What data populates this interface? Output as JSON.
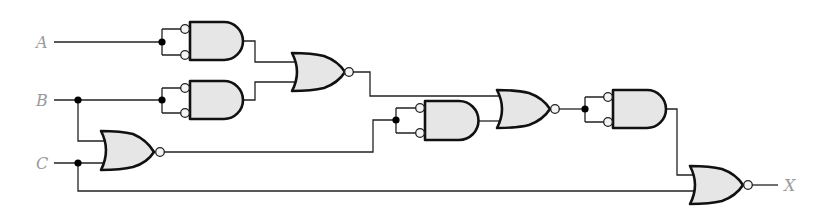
{
  "diagram": {
    "type": "logic-circuit",
    "inputs": [
      {
        "label": "A",
        "x": 40,
        "y": 42
      },
      {
        "label": "B",
        "x": 40,
        "y": 100
      },
      {
        "label": "C",
        "x": 40,
        "y": 163
      }
    ],
    "output": {
      "label": "X",
      "x": 790,
      "y": 185
    },
    "colors": {
      "gate_fill": "#e6e6e6",
      "gate_stroke": "#111111",
      "wire": "#222222",
      "label": "#9a9a9a"
    },
    "gates": [
      {
        "id": "and1",
        "type": "AND",
        "inverted_inputs": true,
        "inputs": [
          "A",
          "A"
        ]
      },
      {
        "id": "and2",
        "type": "AND",
        "inverted_inputs": true,
        "inputs": [
          "B",
          "B"
        ]
      },
      {
        "id": "nor1",
        "type": "NOR",
        "inputs": [
          "and1",
          "and2"
        ]
      },
      {
        "id": "nor2",
        "type": "NOR",
        "inputs": [
          "B",
          "C"
        ]
      },
      {
        "id": "and3",
        "type": "AND",
        "inverted_inputs": true,
        "inputs": [
          "nor2",
          "nor2"
        ]
      },
      {
        "id": "nor3",
        "type": "NOR",
        "inputs": [
          "nor1",
          "and3"
        ]
      },
      {
        "id": "and4",
        "type": "AND",
        "inverted_inputs": true,
        "inputs": [
          "nor3",
          "nor3"
        ]
      },
      {
        "id": "nor4",
        "type": "NOR",
        "inputs": [
          "and4",
          "C"
        ],
        "output": "X"
      }
    ]
  }
}
